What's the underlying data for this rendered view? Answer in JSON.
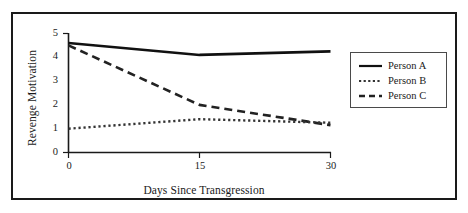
{
  "chart_data": {
    "type": "line",
    "title": "",
    "xlabel": "Days Since Transgression",
    "ylabel": "Revenge Motivation",
    "x": [
      0,
      15,
      30
    ],
    "xlim": [
      0,
      30
    ],
    "ylim": [
      0,
      5
    ],
    "xticks": [
      "0",
      "15",
      "30"
    ],
    "yticks": [
      "0",
      "1",
      "2",
      "3",
      "4",
      "5"
    ],
    "grid": false,
    "legend_position": "right",
    "series": [
      {
        "name": "Person A",
        "style": "solid",
        "color": "#111111",
        "values": [
          4.6,
          4.1,
          4.25
        ]
      },
      {
        "name": "Person B",
        "style": "dotted",
        "color": "#333333",
        "values": [
          1.0,
          1.4,
          1.25
        ]
      },
      {
        "name": "Person C",
        "style": "dashed",
        "color": "#222222",
        "values": [
          4.5,
          2.0,
          1.15
        ]
      }
    ]
  },
  "axes": {
    "y_title": "Revenge Motivation",
    "x_title": "Days Since Transgression",
    "y_ticks": [
      {
        "label": "5"
      },
      {
        "label": "4"
      },
      {
        "label": "3"
      },
      {
        "label": "2"
      },
      {
        "label": "1"
      },
      {
        "label": "0"
      }
    ],
    "x_ticks": [
      {
        "label": "0"
      },
      {
        "label": "15"
      },
      {
        "label": "30"
      }
    ]
  },
  "legend": {
    "entries": [
      {
        "label": "Person A",
        "style": "solid"
      },
      {
        "label": "Person B",
        "style": "dotted"
      },
      {
        "label": "Person C",
        "style": "dashed"
      }
    ]
  }
}
